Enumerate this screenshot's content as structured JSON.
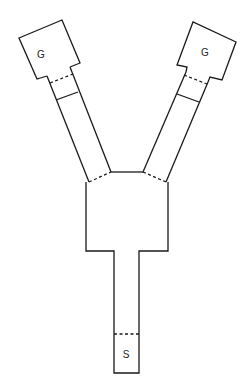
{
  "diagram": {
    "type": "Y-maze",
    "labels": {
      "goal_left": "G",
      "goal_right": "G",
      "start": "S"
    },
    "stroke_color": "#1a1a1a",
    "background": "#ffffff"
  }
}
